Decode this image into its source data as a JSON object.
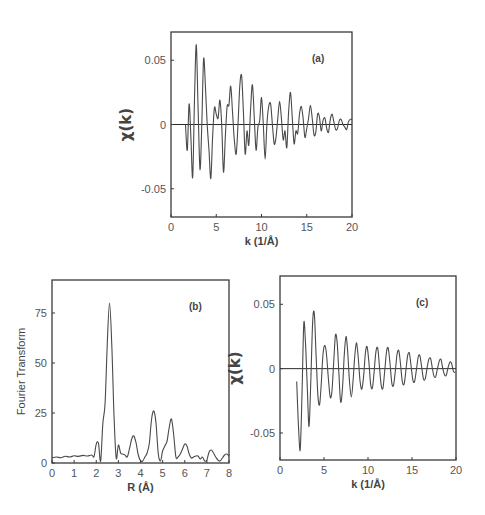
{
  "chart_data": [
    {
      "id": "a",
      "type": "line",
      "panel_label": "(a)",
      "title": "",
      "xlabel": "k (1/Å)",
      "ylabel": "χ(k)",
      "xlim": [
        0,
        20
      ],
      "ylim": [
        -0.072,
        0.072
      ],
      "xticks": [
        0,
        5,
        10,
        15,
        20
      ],
      "xtick_labels": [
        "0",
        "5",
        "10",
        "15",
        "20"
      ],
      "yticks": [
        -0.05,
        0,
        0.05
      ],
      "ytick_labels": [
        "-0.05",
        "0",
        "0.05"
      ],
      "grid": false,
      "zero_line": true,
      "series": [
        {
          "name": "experimental chi(k)",
          "x": [
            1.6,
            1.8,
            2.0,
            2.2,
            2.4,
            2.6,
            2.8,
            3.0,
            3.2,
            3.4,
            3.6,
            3.8,
            4.0,
            4.2,
            4.4,
            4.6,
            4.8,
            5.0,
            5.2,
            5.4,
            5.6,
            5.8,
            6.0,
            6.2,
            6.4,
            6.6,
            6.8,
            7.0,
            7.2,
            7.4,
            7.6,
            7.8,
            8.0,
            8.2,
            8.4,
            8.6,
            8.8,
            9.0,
            9.2,
            9.4,
            9.6,
            9.8,
            10.0,
            10.2,
            10.4,
            10.6,
            10.8,
            11.0,
            11.2,
            11.4,
            11.6,
            11.8,
            12.0,
            12.2,
            12.4,
            12.6,
            12.8,
            13.0,
            13.2,
            13.4,
            13.6,
            13.8,
            14.0,
            14.2,
            14.4,
            14.6,
            14.8,
            15.0,
            15.2,
            15.4,
            15.6,
            15.8,
            16.0,
            16.2,
            16.4,
            16.6,
            16.8,
            17.0,
            17.2,
            17.4,
            17.6,
            17.8,
            18.0,
            18.2,
            18.4,
            18.6,
            18.8,
            19.0,
            19.2,
            19.4,
            19.6,
            19.8,
            20.0
          ],
          "y": [
            0.0,
            -0.02,
            0.016,
            -0.01,
            -0.041,
            0.02,
            0.062,
            0.01,
            -0.035,
            0.0,
            0.051,
            0.03,
            0.0,
            -0.02,
            -0.042,
            -0.01,
            0.013,
            0.008,
            0.005,
            0.019,
            0.0,
            -0.037,
            -0.01,
            0.014,
            0.015,
            0.03,
            0.01,
            -0.012,
            -0.023,
            0.0,
            0.03,
            0.038,
            0.01,
            -0.023,
            -0.005,
            -0.016,
            0.012,
            0.031,
            0.005,
            -0.02,
            -0.002,
            0.003,
            0.021,
            0.0,
            -0.027,
            0.0,
            0.014,
            0.016,
            0.0,
            -0.015,
            -0.01,
            0.005,
            0.018,
            0.005,
            -0.012,
            -0.005,
            -0.018,
            0.01,
            0.025,
            0.005,
            -0.015,
            -0.005,
            -0.007,
            0.008,
            0.014,
            0.005,
            -0.01,
            -0.003,
            0.005,
            0.015,
            0.005,
            -0.008,
            -0.006,
            0.008,
            0.006,
            -0.005,
            0.003,
            0.005,
            -0.003,
            -0.006,
            0.004,
            0.008,
            0.002,
            -0.004,
            -0.003,
            0.003,
            0.004,
            0.0,
            -0.002,
            -0.004,
            0.002,
            0.004,
            0.004
          ]
        }
      ]
    },
    {
      "id": "b",
      "type": "line",
      "panel_label": "(b)",
      "title": "",
      "xlabel": "R (Å)",
      "ylabel": "Fourier Transform",
      "xlim": [
        0,
        8
      ],
      "ylim": [
        0,
        91.5
      ],
      "xticks": [
        0,
        1,
        2,
        3,
        4,
        5,
        6,
        7,
        8
      ],
      "xtick_labels": [
        "0",
        "1",
        "2",
        "3",
        "4",
        "5",
        "6",
        "7",
        "8"
      ],
      "yticks": [
        0,
        25,
        50,
        75
      ],
      "ytick_labels": [
        "0",
        "25",
        "50",
        "75"
      ],
      "grid": false,
      "zero_line": false,
      "series": [
        {
          "name": "FT magnitude",
          "x": [
            0.0,
            0.2,
            0.4,
            0.6,
            0.8,
            1.0,
            1.2,
            1.4,
            1.6,
            1.8,
            1.9,
            2.0,
            2.1,
            2.2,
            2.3,
            2.4,
            2.5,
            2.6,
            2.7,
            2.8,
            2.9,
            3.0,
            3.1,
            3.2,
            3.3,
            3.4,
            3.5,
            3.6,
            3.7,
            3.8,
            3.9,
            4.0,
            4.1,
            4.2,
            4.3,
            4.4,
            4.5,
            4.6,
            4.7,
            4.8,
            4.9,
            5.0,
            5.1,
            5.2,
            5.3,
            5.4,
            5.5,
            5.6,
            5.7,
            5.8,
            5.9,
            6.0,
            6.1,
            6.2,
            6.3,
            6.4,
            6.5,
            6.6,
            6.7,
            6.8,
            6.9,
            7.0,
            7.1,
            7.2,
            7.3,
            7.4,
            7.5,
            7.6,
            7.7,
            7.8,
            7.9,
            8.0
          ],
          "y": [
            2.5,
            3.0,
            2.6,
            3.4,
            3.0,
            3.6,
            3.3,
            3.8,
            3.5,
            4.0,
            3.2,
            9.5,
            9.8,
            1.0,
            20.0,
            30.0,
            60.0,
            80.0,
            60.0,
            25.0,
            2.5,
            9.0,
            5.0,
            4.5,
            4.0,
            3.0,
            7.0,
            12.0,
            13.5,
            10.0,
            4.0,
            1.2,
            1.0,
            3.0,
            5.0,
            10.0,
            22.0,
            26.0,
            20.0,
            5.0,
            1.0,
            6.0,
            8.5,
            11.0,
            18.0,
            22.0,
            14.0,
            3.0,
            3.0,
            4.5,
            7.0,
            9.5,
            8.5,
            4.5,
            2.5,
            3.0,
            3.5,
            3.5,
            2.0,
            3.0,
            1.0,
            1.5,
            5.5,
            6.5,
            5.0,
            3.0,
            1.5,
            1.0,
            2.5,
            4.0,
            4.5,
            3.5
          ]
        }
      ]
    },
    {
      "id": "c",
      "type": "line",
      "panel_label": "(c)",
      "title": "",
      "xlabel": "k (1/Å)",
      "ylabel": "χ(k)",
      "xlim": [
        0,
        20
      ],
      "ylim": [
        -0.071,
        0.072
      ],
      "xticks": [
        0,
        5,
        10,
        15,
        20
      ],
      "xtick_labels": [
        "0",
        "5",
        "10",
        "15",
        "20"
      ],
      "yticks": [
        -0.05,
        0,
        0.05
      ],
      "ytick_labels": [
        "-0.05",
        "0",
        "0.05"
      ],
      "grid": false,
      "zero_line": true,
      "series": [
        {
          "name": "filtered chi(k)",
          "x": [
            1.9,
            2.1,
            2.3,
            2.5,
            2.7,
            2.9,
            3.1,
            3.3,
            3.5,
            3.7,
            3.9,
            4.1,
            4.3,
            4.5,
            4.7,
            4.9,
            5.1,
            5.3,
            5.5,
            5.7,
            5.9,
            6.1,
            6.3,
            6.5,
            6.7,
            6.9,
            7.1,
            7.3,
            7.5,
            7.7,
            7.9,
            8.1,
            8.3,
            8.5,
            8.7,
            8.9,
            9.1,
            9.3,
            9.5,
            9.7,
            9.9,
            10.1,
            10.3,
            10.5,
            10.7,
            10.9,
            11.1,
            11.3,
            11.5,
            11.7,
            11.9,
            12.1,
            12.3,
            12.5,
            12.7,
            12.9,
            13.1,
            13.3,
            13.5,
            13.7,
            13.9,
            14.1,
            14.3,
            14.5,
            14.7,
            14.9,
            15.1,
            15.3,
            15.5,
            15.7,
            15.9,
            16.1,
            16.3,
            16.5,
            16.7,
            16.9,
            17.1,
            17.3,
            17.5,
            17.7,
            17.9,
            18.1,
            18.3,
            18.5,
            18.7,
            18.9,
            19.1,
            19.3,
            19.5,
            19.7,
            19.9
          ],
          "y": [
            -0.01,
            -0.045,
            -0.063,
            -0.02,
            0.035,
            0.02,
            -0.015,
            -0.045,
            -0.01,
            0.035,
            0.043,
            0.01,
            -0.02,
            -0.028,
            -0.01,
            0.012,
            0.018,
            0.01,
            -0.008,
            -0.022,
            -0.018,
            0.005,
            0.026,
            0.02,
            -0.005,
            -0.026,
            -0.015,
            0.01,
            0.025,
            0.012,
            -0.01,
            -0.022,
            -0.01,
            0.01,
            0.02,
            0.008,
            -0.01,
            -0.016,
            -0.006,
            0.012,
            0.017,
            0.005,
            -0.012,
            -0.015,
            -0.002,
            0.013,
            0.016,
            0.002,
            -0.013,
            -0.015,
            -0.002,
            0.013,
            0.016,
            0.004,
            -0.011,
            -0.013,
            -0.002,
            0.011,
            0.014,
            0.003,
            -0.01,
            -0.012,
            -0.002,
            0.01,
            0.012,
            0.002,
            -0.009,
            -0.01,
            -0.001,
            0.009,
            0.01,
            0.001,
            -0.008,
            -0.008,
            0.0,
            0.007,
            0.008,
            0.001,
            -0.006,
            -0.006,
            0.0,
            0.006,
            0.007,
            0.0,
            -0.005,
            -0.005,
            0.001,
            0.005,
            0.004,
            -0.002,
            -0.003
          ]
        }
      ]
    }
  ]
}
